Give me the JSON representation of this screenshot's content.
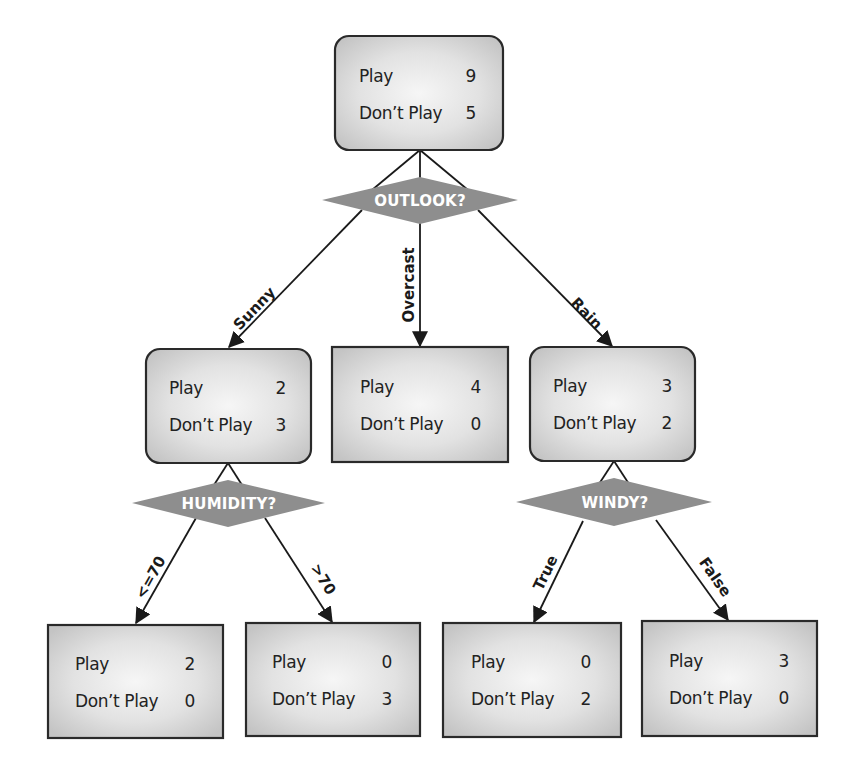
{
  "colors": {
    "box_fill_center": "#f4f4f4",
    "box_fill_edge": "#c8c8c8",
    "box_stroke": "#2a2a2a",
    "diamond_fill": "#8e8e8e",
    "diamond_text": "#ffffff",
    "edge": "#1a1a1a",
    "text": "#222222"
  },
  "tree": {
    "root": {
      "shape": "rounded-rect",
      "rows": [
        {
          "label": "Play",
          "value": "9"
        },
        {
          "label": "Don’t Play",
          "value": "5"
        }
      ],
      "split": "OUTLOOK?"
    },
    "level1": [
      {
        "edge_label": "Sunny",
        "shape": "rounded-rect",
        "rows": [
          {
            "label": "Play",
            "value": "2"
          },
          {
            "label": "Don’t Play",
            "value": "3"
          }
        ],
        "split": "HUMIDITY?"
      },
      {
        "edge_label": "Overcast",
        "shape": "rect",
        "rows": [
          {
            "label": "Play",
            "value": "4"
          },
          {
            "label": "Don’t Play",
            "value": "0"
          }
        ]
      },
      {
        "edge_label": "Rain",
        "shape": "rounded-rect",
        "rows": [
          {
            "label": "Play",
            "value": "3"
          },
          {
            "label": "Don’t Play",
            "value": "2"
          }
        ],
        "split": "WINDY?"
      }
    ],
    "level2": [
      {
        "parent": "HUMIDITY?",
        "edge_label": "<=70",
        "shape": "rect",
        "rows": [
          {
            "label": "Play",
            "value": "2"
          },
          {
            "label": "Don’t Play",
            "value": "0"
          }
        ]
      },
      {
        "parent": "HUMIDITY?",
        "edge_label": ">70",
        "shape": "rect",
        "rows": [
          {
            "label": "Play",
            "value": "0"
          },
          {
            "label": "Don’t Play",
            "value": "3"
          }
        ]
      },
      {
        "parent": "WINDY?",
        "edge_label": "True",
        "shape": "rect",
        "rows": [
          {
            "label": "Play",
            "value": "0"
          },
          {
            "label": "Don’t Play",
            "value": "2"
          }
        ]
      },
      {
        "parent": "WINDY?",
        "edge_label": "False",
        "shape": "rect",
        "rows": [
          {
            "label": "Play",
            "value": "3"
          },
          {
            "label": "Don’t Play",
            "value": "0"
          }
        ]
      }
    ]
  }
}
